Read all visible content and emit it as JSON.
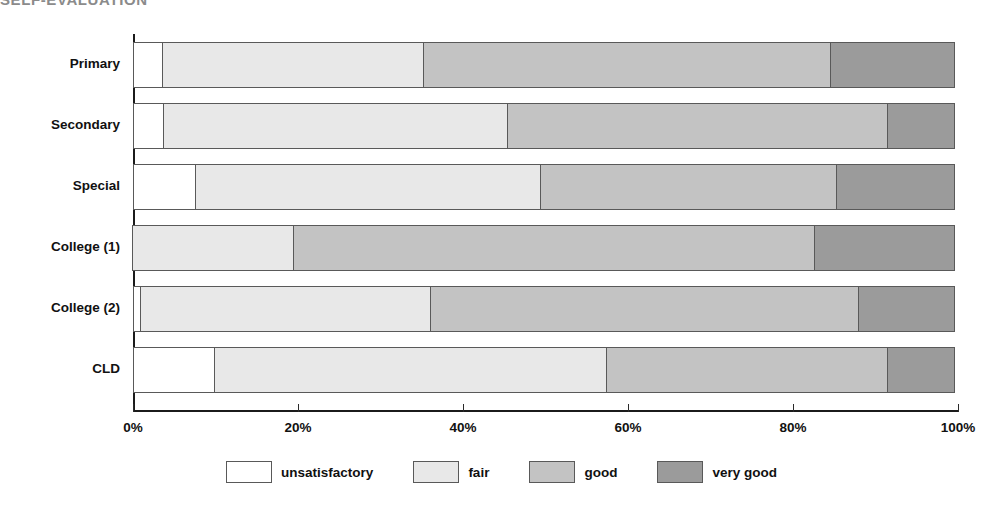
{
  "title": "SELF-EVALUATION",
  "chart_data": {
    "type": "bar",
    "orientation": "horizontal",
    "stacked": true,
    "normalized": true,
    "title": "SELF-EVALUATION",
    "xlabel": "",
    "ylabel": "",
    "xlim": [
      0,
      100
    ],
    "grid": false,
    "legend_position": "bottom",
    "categories": [
      "Primary",
      "Secondary",
      "Special",
      "College (1)",
      "College (2)",
      "CLD"
    ],
    "tick_labels": [
      "0%",
      "20%",
      "40%",
      "60%",
      "80%",
      "100%"
    ],
    "tick_values": [
      0,
      20,
      40,
      60,
      80,
      100
    ],
    "series": [
      {
        "name": "unsatisfactory",
        "color": "#ffffff",
        "values": [
          3.6,
          3.8,
          7.6,
          0,
          1.0,
          9.9
        ]
      },
      {
        "name": "fair",
        "color": "#e8e8e8",
        "values": [
          31.8,
          41.8,
          42.0,
          19.6,
          35.2,
          47.7
        ]
      },
      {
        "name": "good",
        "color": "#c3c3c3",
        "values": [
          49.4,
          46.2,
          36.0,
          63.3,
          52.1,
          34.2
        ]
      },
      {
        "name": "very good",
        "color": "#9b9b9b",
        "values": [
          15.2,
          8.2,
          14.4,
          17.1,
          11.7,
          8.2
        ]
      }
    ]
  },
  "legend": {
    "items": [
      {
        "label": "unsatisfactory",
        "color": "#ffffff"
      },
      {
        "label": "fair",
        "color": "#e8e8e8"
      },
      {
        "label": "good",
        "color": "#c3c3c3"
      },
      {
        "label": "very good",
        "color": "#9b9b9b"
      }
    ]
  },
  "colors": {
    "axis": "#1b1b1b",
    "segment_border": "#595959",
    "text": "#111111",
    "title": "#8b8b8b",
    "background": "#ffffff"
  }
}
